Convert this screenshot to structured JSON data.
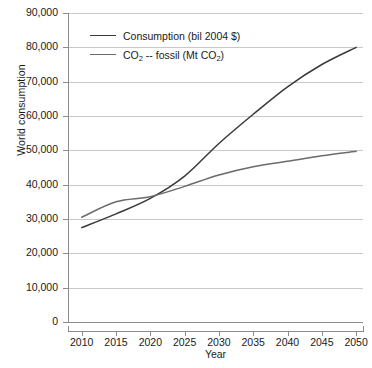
{
  "chart_data": {
    "type": "line",
    "title": "",
    "xlabel": "Year",
    "ylabel": "World consumption",
    "x": [
      2010,
      2015,
      2020,
      2025,
      2030,
      2035,
      2040,
      2045,
      2050
    ],
    "xlim": [
      2008,
      2051
    ],
    "ylim": [
      0,
      90000
    ],
    "grid": true,
    "legend_position": "top-left",
    "xtick_labels": [
      "2010",
      "2015",
      "2020",
      "2025",
      "2030",
      "2035",
      "2040",
      "2045",
      "2050"
    ],
    "ytick_labels": [
      "0",
      "10,000",
      "20,000",
      "30,000",
      "40,000",
      "50,000",
      "60,000",
      "70,000",
      "80,000",
      "90,000"
    ],
    "ytick_values": [
      0,
      10000,
      20000,
      30000,
      40000,
      50000,
      60000,
      70000,
      80000,
      90000
    ],
    "series": [
      {
        "name": "Consumption (bil 2004 $)",
        "name_html": "Consumption (bil 2004 $)",
        "color": "#3a3a3a",
        "values": [
          27500,
          31500,
          36000,
          42500,
          52000,
          60500,
          68500,
          75000,
          80000
        ]
      },
      {
        "name": "CO2 -- fossil (Mt CO2)",
        "name_html": "CO<sub>2</sub> -- fossil (Mt CO<sub>2</sub>)",
        "color": "#6b6b6b",
        "values": [
          30500,
          35000,
          36500,
          39500,
          42800,
          45200,
          46800,
          48400,
          49700
        ]
      }
    ]
  },
  "colors": {
    "background": "#ffffff",
    "gridline": "#c9c9c9",
    "axis": "#8c8c8c",
    "text": "#1a1a1a",
    "series_consumption": "#3a3a3a",
    "series_co2": "#6b6b6b"
  }
}
